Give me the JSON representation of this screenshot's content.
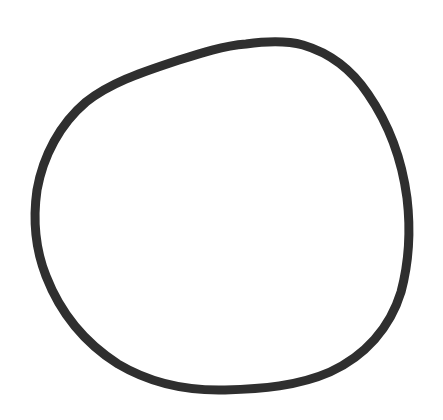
{
  "drawing": {
    "description": "Hand-drawn circle",
    "background_color": "#ffffff",
    "stroke_color": "#2f2f2f",
    "stroke_width": 9,
    "shape": "closed-loop",
    "path": "M 246 44 C 268 41, 288 41, 303 45 C 330 53, 352 70, 368 94 C 388 123, 402 160, 407 198 C 411 232, 409 262, 401 292 C 390 328, 365 356, 330 372 C 298 386, 262 389, 225 390 C 185 391, 150 383, 118 364 C 85 343, 60 312, 46 276 C 35 248, 33 218, 37 190 C 43 156, 60 124, 86 102 C 110 83, 140 73, 170 63 C 195 55, 220 46, 246 44 Z"
  }
}
